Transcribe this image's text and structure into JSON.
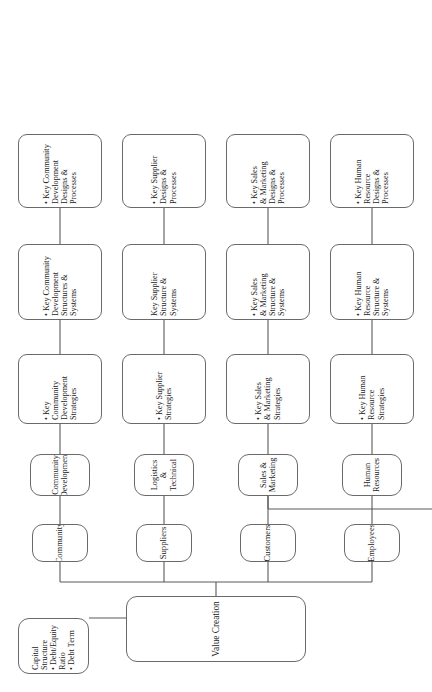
{
  "figure": {
    "title": "Value Creation",
    "orientation": "rotated-90-ccw",
    "root": {
      "label": "Value Creation"
    },
    "capital_structure": {
      "heading": "Capital Structure",
      "bullets": [
        "• Debt/Equity Ratio",
        "• Debt Term"
      ],
      "label": "Capital Structure\n• Debt/Equity Ratio\n• Debt Term"
    },
    "axis_labels": [
      {
        "id": "value-creators",
        "label": "Value\nCreators"
      },
      {
        "id": "value-creating-functions",
        "label": "Value-Creating\nFunctions"
      },
      {
        "id": "value-creating-methods",
        "label": "Value-Creating\nMethods"
      },
      {
        "id": "method-refocus",
        "label": "• Refocus\n   (Strategy)"
      },
      {
        "id": "method-reconfigure",
        "label": "• Reconfigure\n   (Structure &\n   Systems)"
      },
      {
        "id": "method-reengineer",
        "label": "• Reengineer\n   (Design &\n   Process)"
      }
    ],
    "branches": [
      {
        "creator": "Community",
        "function": "Community\nDevelopment",
        "refocus": "• Key\n   Community\n   Development\n   Strategies",
        "reconfigure": "• Key Community\n   Development\n   Structures &\n   Systems",
        "reengineer": "• Key Community\n   Development\n   Designs &\n   Processes"
      },
      {
        "creator": "Suppliers",
        "function": "Logistics &\nTechnical",
        "refocus": "• Key Supplier\n   Strategies",
        "reconfigure": "Key Supplier\nStructure &\nSystems",
        "reengineer": "• Key Supplier\n   Designs &\n   Processes"
      },
      {
        "creator": "Customers",
        "function": "Sales &\nMarketing",
        "refocus": "• Key Sales\n   & Marketing\n   Strategies",
        "reconfigure": "• Key Sales\n   & Marketing\n   Structure &\n   Systems",
        "reengineer": "• Key Sales\n   & Marketing\n   Designs &\n   Processes"
      },
      {
        "creator": "Employees",
        "function": "Human\nResources",
        "refocus": "• Key Human\n   Resource\n   Strategies",
        "reconfigure": "• Key Human\n   Resource\n   Structure &\n   Systems",
        "reengineer": "• Key Human\n   Resource\n   Designs &\n   Processes"
      },
      {
        "creator": null,
        "function": "Operations &\nSupport",
        "refocus": "• Key\n   Operations\n   Strategies",
        "reconfigure": "• Key\n   Operations\n   Structures &\n   Systems",
        "reengineer": "Key Operations\nDesigns &\nProcesses"
      },
      {
        "creator": null,
        "function": "Product\nDevelopment",
        "refocus": "Key Product\nDevelopment\nStrategies",
        "reconfigure": "• Key Product\n   Development\n   Structures &\n   Systems",
        "reengineer": "• Key Product\n   Development\n   Designs &\n   Processes"
      }
    ]
  }
}
